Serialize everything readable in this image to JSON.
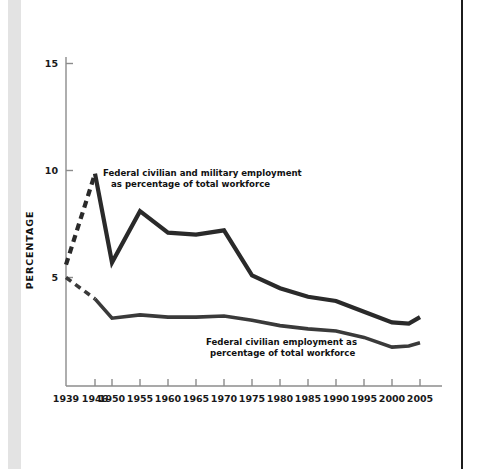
{
  "figure": {
    "background_color": "#ffffff",
    "left_band_color": "#e3e3e3",
    "right_rule_color": "#1c1c1c",
    "line_color": "#2a2a2a",
    "axis_color": "#8c8c8c"
  },
  "axes": {
    "y_title": "PERCENTAGE",
    "y_ticks": [
      "5",
      "10",
      "15"
    ],
    "x_ticks": [
      "1939",
      "1946",
      "1950",
      "1955",
      "1960",
      "1965",
      "1970",
      "1975",
      "1980",
      "1985",
      "1990",
      "1995",
      "2000",
      "2005"
    ]
  },
  "annotations": {
    "upper_line_1": "Federal civilian and military employment",
    "upper_line_2": "as percentage of total workforce",
    "lower_line_1": "Federal civilian employment as",
    "lower_line_2": "percentage of total workforce"
  },
  "chart_data": {
    "type": "line",
    "title": "",
    "xlabel": "",
    "ylabel": "PERCENTAGE",
    "xlim": [
      1939,
      2005
    ],
    "ylim": [
      0,
      15.5
    ],
    "yticks": [
      5,
      10,
      15
    ],
    "xticks": [
      1939,
      1946,
      1950,
      1955,
      1960,
      1965,
      1970,
      1975,
      1980,
      1985,
      1990,
      1995,
      2000,
      2005
    ],
    "grid": false,
    "legend": "inline-annotations",
    "x": [
      1939,
      1946,
      1950,
      1955,
      1960,
      1965,
      1970,
      1975,
      1980,
      1985,
      1990,
      1995,
      2000,
      2003,
      2005
    ],
    "series": [
      {
        "name": "Federal civilian and military employment as percentage of total workforce",
        "values": [
          5.6,
          9.85,
          5.7,
          8.1,
          7.1,
          7.0,
          7.2,
          5.1,
          4.5,
          4.1,
          3.9,
          3.4,
          2.9,
          2.85,
          3.15
        ],
        "dashed_from": 1939,
        "dashed_to": 1946,
        "style": "dashed-then-solid"
      },
      {
        "name": "Federal civilian employment as percentage of total workforce",
        "values": [
          5.0,
          4.0,
          3.1,
          3.25,
          3.15,
          3.15,
          3.2,
          3.0,
          2.75,
          2.6,
          2.5,
          2.2,
          1.75,
          1.8,
          1.95
        ],
        "dashed_from": 1939,
        "dashed_to": 1946,
        "style": "dashed-then-solid"
      }
    ]
  }
}
